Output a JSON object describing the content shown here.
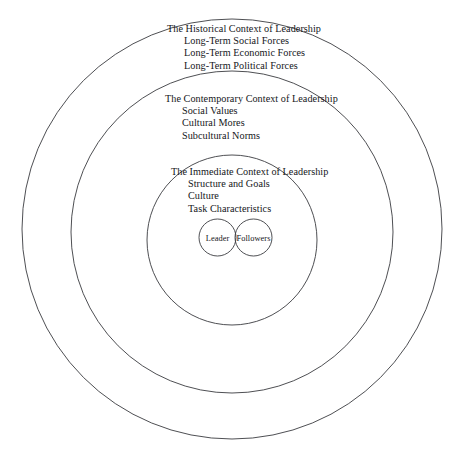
{
  "diagram": {
    "type": "concentric-circles",
    "background_color": "#ffffff",
    "stroke_color": "#3a3b40",
    "text_color": "#15161a",
    "rings": [
      {
        "id": "historical",
        "heading": "The Historical Context of Leadership",
        "items": [
          "Long-Term Social Forces",
          "Long-Term Economic Forces",
          "Long-Term Political Forces"
        ]
      },
      {
        "id": "contemporary",
        "heading": "The Contemporary Context of Leadership",
        "items": [
          "Social Values",
          "Cultural Mores",
          "Subcultural Norms"
        ]
      },
      {
        "id": "immediate",
        "heading": "The Immediate Context of Leadership",
        "items": [
          "Structure and Goals",
          "Culture",
          "Task Characteristics"
        ]
      }
    ],
    "actors": [
      {
        "id": "leader",
        "label": "Leader"
      },
      {
        "id": "followers",
        "label": "Followers"
      }
    ]
  }
}
